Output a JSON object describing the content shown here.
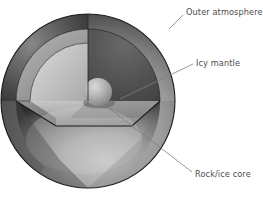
{
  "figure": {
    "name": "planetary-interior-cutaway",
    "background_color": "#ffffff"
  },
  "labels": [
    {
      "id": "outer-atmosphere",
      "text": "Outer atmosphere",
      "x": 186,
      "y": 13,
      "leader": "M 183,15 L 169,29",
      "color": "#4d4d4d"
    },
    {
      "id": "icy-mantle",
      "text": "Icy mantle",
      "x": 196,
      "y": 66,
      "leader": "M 193,64 L 120,99",
      "color": "#4d4d4d"
    },
    {
      "id": "rock-ice-core",
      "text": "Rock/ice core",
      "x": 195,
      "y": 177,
      "leader": "M 192,172 L 101,102",
      "color": "#4d4d4d"
    }
  ],
  "layers": [
    {
      "id": "outer-atmosphere-shell",
      "label": "Outer atmosphere",
      "fill_dark": "#3a3a3a",
      "fill_mid": "#6e6e6e",
      "fill_light": "#b4b4b4"
    },
    {
      "id": "icy-mantle-layer",
      "label": "Icy mantle",
      "fill_dark": "#4a4a4a",
      "fill_mid": "#575757",
      "fill_light": "#9b9b9b"
    },
    {
      "id": "rock-ice-core-sphere",
      "label": "Rock/ice core",
      "fill_dark": "#8d8d8d",
      "fill_mid": "#a8a8a8",
      "fill_light": "#cfcfcf"
    }
  ],
  "colors": {
    "outline": "#1b1b1b",
    "leader": "#7a7d80",
    "text": "#4d4d4d",
    "cut_face_light": "#cdcdcd",
    "cut_face_mid": "#9e9e9e",
    "cut_face_dark": "#7f7f7f",
    "mantle_cut_interior": "#565656",
    "floor_light": "#bdbdbd"
  }
}
